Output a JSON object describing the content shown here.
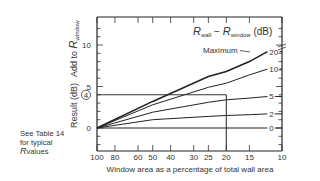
{
  "chart_data": {
    "type": "line",
    "title": "",
    "xlabel": "Window area as a percentage of total wall area",
    "ylabel": "Result (dB)  Add to R_window",
    "ylabel_parts": {
      "result": "Result (dB)",
      "add_to": "Add to ",
      "r": "R",
      "sub": "window"
    },
    "legend_title": {
      "r1": "R",
      "sub1": "wall",
      "minus": " − ",
      "r2": "R",
      "sub2": "window",
      "unit": " (dB)"
    },
    "x_scale": "log",
    "x_reversed": true,
    "xlim": [
      100,
      10
    ],
    "ylim": [
      -3,
      13
    ],
    "x_ticks": [
      100,
      80,
      60,
      50,
      40,
      30,
      25,
      20,
      15,
      10
    ],
    "y_ticks": [
      0,
      5,
      10
    ],
    "y_highlight_tick": "4",
    "grid": false,
    "annotation_maximum": "Maximum",
    "example_guide": {
      "x": 20,
      "y": 4
    },
    "series": [
      {
        "name": "20",
        "points": [
          [
            100,
            0
          ],
          [
            50,
            3.2
          ],
          [
            25,
            6.2
          ],
          [
            20,
            6.8
          ],
          [
            15,
            8.0
          ],
          [
            12,
            9.2
          ]
        ]
      },
      {
        "name": "10",
        "points": [
          [
            100,
            0
          ],
          [
            50,
            2.8
          ],
          [
            25,
            4.9
          ],
          [
            20,
            5.4
          ],
          [
            15,
            6.4
          ],
          [
            12,
            7.1
          ]
        ]
      },
      {
        "name": "5",
        "points": [
          [
            100,
            0
          ],
          [
            50,
            1.9
          ],
          [
            25,
            3.1
          ],
          [
            20,
            3.4
          ],
          [
            15,
            3.6
          ],
          [
            12,
            3.8
          ]
        ]
      },
      {
        "name": "2",
        "points": [
          [
            100,
            0
          ],
          [
            50,
            1.0
          ],
          [
            25,
            1.4
          ],
          [
            20,
            1.5
          ],
          [
            15,
            1.6
          ],
          [
            12,
            1.7
          ]
        ]
      },
      {
        "name": "0",
        "points": [
          [
            100,
            0
          ],
          [
            12,
            0
          ]
        ]
      }
    ]
  },
  "side_note": {
    "line1": "See Table 14",
    "line2": "for typical",
    "r": "R",
    "line3": "values"
  }
}
